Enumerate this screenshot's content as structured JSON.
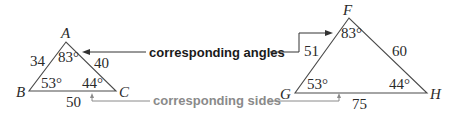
{
  "colors": {
    "lines": "#4a4a4a",
    "text": "#2a2a2a",
    "angles_callout": "#1a1a1a",
    "sides_callout": "#8a8a8a"
  },
  "triangle_abc": {
    "vertices": {
      "A": "A",
      "B": "B",
      "C": "C"
    },
    "sides": {
      "AB": "34",
      "AC": "40",
      "BC": "50"
    },
    "angles": {
      "A": "83°",
      "B": "53°",
      "C": "44°"
    }
  },
  "triangle_fgh": {
    "vertices": {
      "F": "F",
      "G": "G",
      "H": "H"
    },
    "sides": {
      "FG": "51",
      "FH": "60",
      "GH": "75"
    },
    "angles": {
      "F": "83°",
      "G": "53°",
      "H": "44°"
    }
  },
  "callouts": {
    "angles": "corresponding angles",
    "sides": "corresponding sides"
  }
}
